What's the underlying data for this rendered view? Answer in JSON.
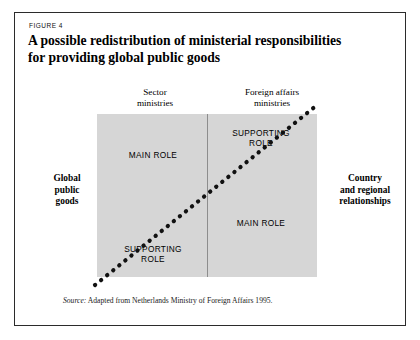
{
  "figure": {
    "label": "FIGURE 4",
    "title_line1": "A possible redistribution of ministerial responsibilities",
    "title_line2": "for providing global public goods",
    "source_prefix": "Source:",
    "source_text": " Adapted from Netherlands Ministry of Foreign Affairs 1995."
  },
  "columns": {
    "left_header": "Sector\nministries",
    "right_header": "Foreign affairs\nministries"
  },
  "sides": {
    "left_label": "Global\npublic\ngoods",
    "right_label": "Country\nand regional\nrelationships"
  },
  "matrix": {
    "top_left": "MAIN ROLE",
    "top_right": "SUPPORTING\nROLE",
    "bottom_right": "MAIN ROLE",
    "bottom_left": "SUPPORTING\nROLE",
    "fill_color": "#d6d6d6",
    "divider_color": "#8d8d8d",
    "diagonal_color": "#111111",
    "diagonal_style": "dotted"
  },
  "page": {
    "border_color": "#2b2b2b",
    "background": "#ffffff"
  }
}
